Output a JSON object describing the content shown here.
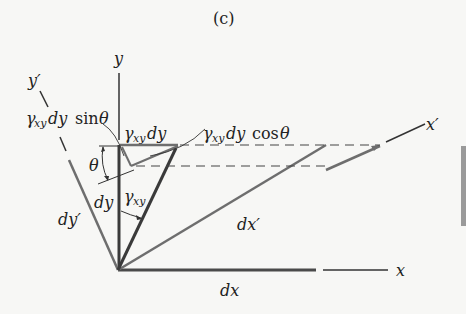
{
  "figure": {
    "panel_label": "(c)",
    "axes": {
      "x_label": "x",
      "y_label": "y",
      "x_prime_label": "x′",
      "y_prime_label": "y′"
    },
    "segments": {
      "dx": "dx",
      "dy": "dy",
      "dx_prime": "dx′",
      "dy_prime": "dy′"
    },
    "angles": {
      "theta": "θ",
      "gamma_symbol": "γ",
      "gamma_subscript": "xy"
    },
    "annotations": {
      "shear_disp": {
        "gamma": "γ",
        "sub": "xy",
        "rest": "dy"
      },
      "shear_sin": {
        "gamma": "γ",
        "sub": "xy",
        "rest": "dy",
        "func": "sin",
        "angle": "θ"
      },
      "shear_cos": {
        "gamma": "γ",
        "sub": "xy",
        "rest": "dy",
        "func": "cos",
        "angle": "θ"
      }
    },
    "colors": {
      "axis_dark": "#3a3a3a",
      "element_gray": "#6e6e6e",
      "dashed": "#444444",
      "background": "#f7f7f5",
      "side_bar": "#9a9a9a"
    }
  }
}
